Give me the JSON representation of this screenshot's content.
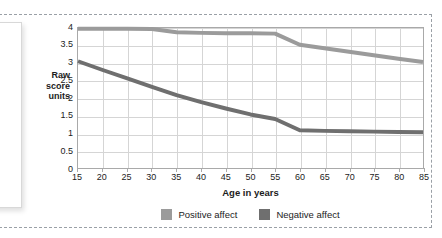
{
  "chart_data": {
    "type": "line",
    "title": "",
    "xlabel": "Age in years",
    "ylabel": "Raw score units",
    "ylabel_lines": [
      "Raw",
      "score",
      "units"
    ],
    "x": [
      15,
      20,
      25,
      30,
      35,
      40,
      45,
      50,
      55,
      60,
      65,
      70,
      75,
      80,
      85
    ],
    "xlim": [
      15,
      85
    ],
    "ylim": [
      0,
      4
    ],
    "xticks": [
      15,
      20,
      25,
      30,
      35,
      40,
      45,
      50,
      55,
      60,
      65,
      70,
      75,
      80,
      85
    ],
    "yticks": [
      0,
      0.5,
      1,
      1.5,
      2,
      2.5,
      3,
      3.5,
      4
    ],
    "ytick_labels": [
      "0",
      "0.5",
      "1",
      "1.5",
      "2",
      "2.5",
      "3",
      "3.5",
      "4"
    ],
    "grid": true,
    "legend_position": "bottom",
    "series": [
      {
        "name": "Positive affect",
        "color": "#9b9b9b",
        "values": [
          3.98,
          3.98,
          3.98,
          3.97,
          3.88,
          3.86,
          3.85,
          3.85,
          3.84,
          3.52,
          3.42,
          3.32,
          3.22,
          3.12,
          3.03
        ]
      },
      {
        "name": "Negative affect",
        "color": "#6f6f6f",
        "values": [
          3.05,
          2.8,
          2.56,
          2.32,
          2.08,
          1.88,
          1.7,
          1.53,
          1.4,
          1.08,
          1.06,
          1.05,
          1.04,
          1.03,
          1.02
        ]
      }
    ]
  },
  "legend": {
    "items": [
      {
        "label": "Positive affect",
        "color": "#9b9b9b"
      },
      {
        "label": "Negative affect",
        "color": "#6f6f6f"
      }
    ]
  },
  "colors": {
    "positive_affect": "#9b9b9b",
    "negative_affect": "#6f6f6f",
    "grid": "#d5d5d5",
    "axis": "#a9a9a9",
    "text": "#1c1c1c",
    "frame_dash": "#9aa0a6"
  }
}
